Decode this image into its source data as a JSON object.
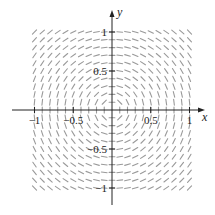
{
  "chart_data": {
    "type": "slope-field",
    "title": "",
    "equation": "dy/dx = -x/y",
    "xlabel": "x",
    "ylabel": "y",
    "xlim": [
      -1.05,
      1.05
    ],
    "ylim": [
      -1.05,
      1.05
    ],
    "grid_step": 0.1,
    "field_range": [
      -1,
      1
    ],
    "grid": false,
    "segment_color": "#9a9a9a",
    "axis_color": "#222222",
    "x_ticks": [
      {
        "value": -1,
        "label": "−1"
      },
      {
        "value": -0.5,
        "label": "−0.5"
      },
      {
        "value": 0.5,
        "label": "0.5"
      },
      {
        "value": 1,
        "label": "1"
      }
    ],
    "y_ticks": [
      {
        "value": 1,
        "label": "1"
      },
      {
        "value": 0.5,
        "label": "0.5"
      },
      {
        "value": -0.5,
        "label": "−0.5"
      },
      {
        "value": -1,
        "label": "−1"
      }
    ]
  }
}
